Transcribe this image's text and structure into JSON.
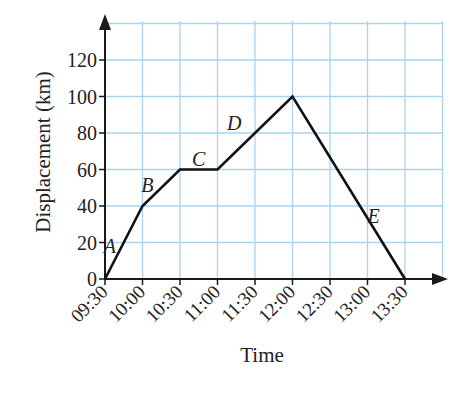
{
  "chart_data": {
    "type": "line",
    "title": "",
    "xlabel": "Time",
    "ylabel": "Displacement (km)",
    "x": [
      "09:30",
      "10:00",
      "10:30",
      "11:00",
      "11:30",
      "12:00",
      "12:30",
      "13:00",
      "13:30"
    ],
    "y_ticks": [
      0,
      20,
      40,
      60,
      80,
      100,
      120
    ],
    "ylim": [
      0,
      130
    ],
    "grid": true,
    "legend": null,
    "series": [
      {
        "name": "journey",
        "points": [
          {
            "x": "09:30",
            "y": 0
          },
          {
            "x": "10:00",
            "y": 40
          },
          {
            "x": "10:30",
            "y": 60
          },
          {
            "x": "11:00",
            "y": 60
          },
          {
            "x": "12:00",
            "y": 100
          },
          {
            "x": "13:30",
            "y": 0
          }
        ]
      }
    ],
    "annotations": [
      {
        "text": "A",
        "segment": "09:30–10:00"
      },
      {
        "text": "B",
        "segment": "10:00–10:30"
      },
      {
        "text": "C",
        "segment": "10:30–11:00"
      },
      {
        "text": "D",
        "segment": "11:00–12:00"
      },
      {
        "text": "E",
        "segment": "12:00–13:30"
      }
    ],
    "colors": {
      "line": "#111111",
      "grid": "#a9d3ef",
      "axis": "#1a1a1a"
    }
  }
}
